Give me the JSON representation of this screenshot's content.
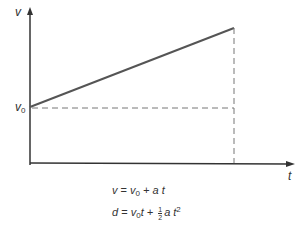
{
  "axes": {
    "y_label": "v",
    "x_label": "t"
  },
  "annotations": {
    "v0_label": "v",
    "v0_sub": "0"
  },
  "equations": {
    "eq1": {
      "lhs": "v",
      "eqs": " = ",
      "v": "v",
      "sub": "0",
      "rest": " + a t"
    },
    "eq2": {
      "lhs": "d",
      "eqs": " = ",
      "v": "v",
      "sub": "0",
      "t": "t + ",
      "num": "1",
      "den": "2",
      "at": "a t",
      "exp": "2"
    }
  },
  "colors": {
    "line": "#555555",
    "axis": "#333333",
    "dash": "#777777"
  }
}
